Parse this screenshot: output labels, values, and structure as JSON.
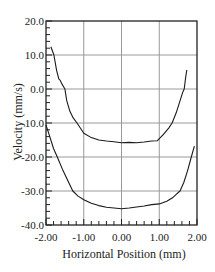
{
  "chart_data": {
    "type": "line",
    "title": "",
    "xlabel": "Horizontal Position (mm)",
    "ylabel": "Velocity (mm/s)",
    "xlim": [
      -2.0,
      2.0
    ],
    "ylim": [
      -40.0,
      20.0
    ],
    "x_ticks": [
      "-2.00",
      "-1.00",
      "0.00",
      "1.00",
      "2.00"
    ],
    "y_ticks": [
      "20.0",
      "10.0",
      "0.0",
      "-10.0",
      "-20.0",
      "-30.0",
      "-40.0"
    ],
    "grid": true,
    "legend": null,
    "series": [
      {
        "name": "upper curve",
        "x": [
          -1.87,
          -1.79,
          -1.72,
          -1.66,
          -1.62,
          -1.58,
          -1.5,
          -1.45,
          -1.37,
          -1.28,
          -1.18,
          -1.0,
          -0.8,
          -0.6,
          -0.4,
          -0.2,
          0.0,
          0.2,
          0.4,
          0.6,
          0.8,
          0.95,
          1.1,
          1.25,
          1.34,
          1.45,
          1.55,
          1.62,
          1.66,
          1.7,
          1.73
        ],
        "y": [
          12.4,
          10.0,
          5.5,
          3.0,
          2.5,
          1.5,
          0.0,
          -3.5,
          -6.5,
          -8.5,
          -10.0,
          -13.0,
          -14.3,
          -15.0,
          -15.3,
          -15.5,
          -15.8,
          -15.7,
          -15.8,
          -15.6,
          -15.3,
          -15.2,
          -13.5,
          -11.5,
          -10.0,
          -7.0,
          -3.5,
          -1.0,
          0.0,
          3.5,
          5.6
        ]
      },
      {
        "name": "lower curve",
        "x": [
          -2.0,
          -1.9,
          -1.8,
          -1.7,
          -1.55,
          -1.4,
          -1.29,
          -1.15,
          -1.0,
          -0.8,
          -0.6,
          -0.4,
          -0.2,
          0.0,
          0.2,
          0.4,
          0.6,
          0.8,
          1.0,
          1.2,
          1.35,
          1.45,
          1.55,
          1.65,
          1.75,
          1.85,
          1.93
        ],
        "y": [
          -10.6,
          -14.0,
          -17.5,
          -20.0,
          -24.0,
          -27.5,
          -30.0,
          -31.5,
          -32.6,
          -33.6,
          -34.3,
          -34.8,
          -35.0,
          -35.2,
          -35.0,
          -34.7,
          -34.4,
          -34.0,
          -33.8,
          -33.0,
          -32.0,
          -31.0,
          -30.0,
          -27.5,
          -24.0,
          -20.0,
          -16.8
        ]
      }
    ]
  },
  "colors": {
    "background": "#ffffff",
    "axis": "#222222",
    "grid": "#999999",
    "line": "#1a1a1a"
  }
}
